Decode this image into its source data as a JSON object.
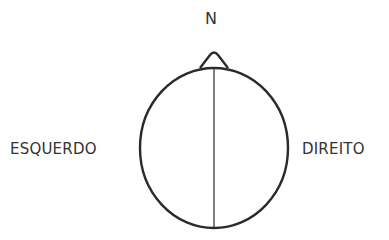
{
  "diagram": {
    "labels": {
      "north": "N",
      "left": "ESQUERDO",
      "right": "DIREITO"
    },
    "shapes": {
      "head": {
        "type": "ellipse",
        "cx": 214,
        "cy": 148,
        "rx": 74,
        "ry": 80
      },
      "nose": {
        "type": "triangle",
        "tip": [
          214,
          52
        ]
      },
      "midline": {
        "type": "line",
        "x": 214,
        "y1": 68,
        "y2": 228
      }
    },
    "colors": {
      "stroke": "#2a2a2a",
      "text": "#333333",
      "background": "#ffffff"
    }
  }
}
